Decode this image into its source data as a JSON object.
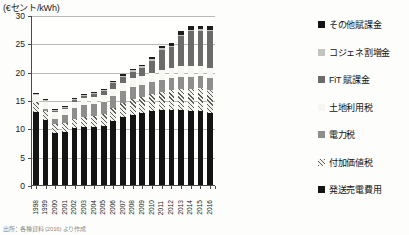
{
  "unit_label": "(€セント/kWh)",
  "caption": "出所：各種資料 (2016) より作成",
  "legend": {
    "items": [
      {
        "label": "その他賦課金",
        "key": "other_levy",
        "swatch": "black"
      },
      {
        "label": "コジェネ割増金",
        "key": "cogen",
        "swatch": "light-gray"
      },
      {
        "label": "FiT 賦課金",
        "key": "fit_levy",
        "swatch": "dark-gray"
      },
      {
        "label": "土地利用税",
        "key": "land_tax",
        "swatch": "dots"
      },
      {
        "label": "電力税",
        "key": "power_tax",
        "swatch": "mid-gray"
      },
      {
        "label": "付加価値税",
        "key": "vat",
        "swatch": "hatch"
      },
      {
        "label": "発送売電費用",
        "key": "generation",
        "swatch": "black"
      }
    ]
  },
  "chart_data": {
    "type": "bar",
    "stacked": true,
    "title": "",
    "xlabel": "",
    "ylabel": "€セント/kWh",
    "ylim": [
      0,
      30
    ],
    "yticks": [
      0,
      5,
      10,
      15,
      20,
      25,
      30
    ],
    "grid": true,
    "legend_position": "right",
    "categories": [
      "1998",
      "1999",
      "2000",
      "2001",
      "2002",
      "2003",
      "2004",
      "2005",
      "2006",
      "2007",
      "2008",
      "2009",
      "2010",
      "2011",
      "2012",
      "2013",
      "2014",
      "2015",
      "2016"
    ],
    "series": [
      {
        "name": "発送売電費用",
        "key": "generation",
        "values": [
          13.0,
          11.6,
          9.4,
          9.6,
          10.2,
          10.4,
          10.5,
          10.6,
          11.4,
          12.1,
          12.6,
          12.9,
          13.2,
          13.4,
          13.5,
          13.4,
          13.2,
          13.2,
          12.9
        ]
      },
      {
        "name": "付加価値税",
        "key": "vat",
        "values": [
          1.8,
          1.7,
          1.5,
          1.6,
          1.7,
          1.8,
          1.9,
          2.1,
          2.3,
          2.5,
          2.7,
          2.8,
          3.0,
          3.2,
          3.5,
          3.8,
          4.0,
          4.1,
          4.1
        ]
      },
      {
        "name": "電力税",
        "key": "power_tax",
        "values": [
          0.0,
          0.3,
          1.0,
          1.3,
          1.8,
          2.1,
          2.1,
          2.1,
          2.1,
          2.1,
          2.1,
          2.1,
          2.1,
          2.1,
          2.1,
          2.1,
          2.1,
          2.1,
          2.1
        ]
      },
      {
        "name": "土地利用税",
        "key": "land_tax",
        "values": [
          1.2,
          1.2,
          1.1,
          1.1,
          1.1,
          1.2,
          1.2,
          1.3,
          1.4,
          1.5,
          1.6,
          1.7,
          1.7,
          1.8,
          1.8,
          1.8,
          1.8,
          1.8,
          1.8
        ]
      },
      {
        "name": "FiT 賦課金",
        "key": "fit_levy",
        "values": [
          0.1,
          0.1,
          0.2,
          0.2,
          0.3,
          0.4,
          0.5,
          0.7,
          0.9,
          1.1,
          1.2,
          1.3,
          2.1,
          3.5,
          3.6,
          5.3,
          6.2,
          6.2,
          6.4
        ]
      },
      {
        "name": "コジェネ割増金",
        "key": "cogen",
        "values": [
          0.2,
          0.2,
          0.2,
          0.2,
          0.2,
          0.2,
          0.2,
          0.2,
          0.2,
          0.2,
          0.2,
          0.3,
          0.3,
          0.3,
          0.3,
          0.3,
          0.3,
          0.3,
          0.3
        ]
      },
      {
        "name": "その他賦課金",
        "key": "other_levy",
        "values": [
          0.2,
          0.2,
          0.2,
          0.2,
          0.2,
          0.2,
          0.2,
          0.2,
          0.2,
          0.2,
          0.3,
          0.3,
          0.3,
          0.4,
          0.5,
          0.6,
          0.6,
          0.6,
          0.6
        ]
      }
    ],
    "totals": [
      16.5,
      15.3,
      13.6,
      14.2,
      15.5,
      16.3,
      16.6,
      17.2,
      18.5,
      19.7,
      20.7,
      21.4,
      22.7,
      24.7,
      25.3,
      27.3,
      28.2,
      28.3,
      28.2
    ]
  }
}
